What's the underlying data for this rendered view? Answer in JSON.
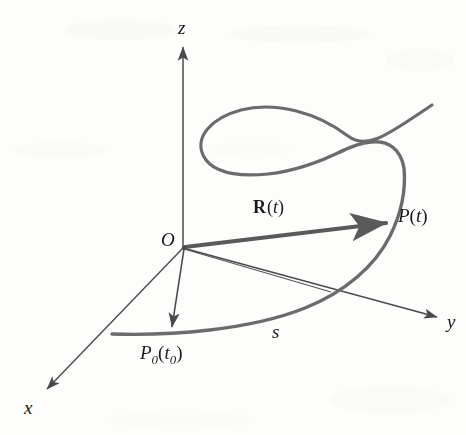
{
  "figure": {
    "background_color": "#fdfdfc",
    "curve_color": "#6b6b6b",
    "axis_color": "#4a4a4a",
    "vector_color": "#5a5a5a",
    "label_color": "#1a1a1a"
  },
  "axes": [
    {
      "name": "z-axis",
      "label": "z",
      "x": 178,
      "y": 18
    },
    {
      "name": "y-axis",
      "label": "y",
      "x": 447,
      "y": 312
    },
    {
      "name": "x-axis",
      "label": "x",
      "x": 24,
      "y": 398
    }
  ],
  "points": [
    {
      "name": "origin",
      "label": "O",
      "x": 161,
      "y": 230
    },
    {
      "name": "point-p-of-t",
      "label_main": "P",
      "label_paren_open": "(",
      "label_arg": "t",
      "label_paren_close": ")",
      "x": 398,
      "y": 206
    },
    {
      "name": "point-p-zero",
      "label_main": "P",
      "label_sub": "0",
      "label_paren_open": "(",
      "label_arg": "t",
      "label_arg_sub": "0",
      "label_paren_close": ")",
      "x": 140,
      "y": 343
    }
  ],
  "vector": {
    "name": "position-vector",
    "bold_symbol": "R",
    "paren_open": "(",
    "arg": "t",
    "paren_close": ")",
    "x": 253,
    "y": 198
  },
  "arc_length": {
    "name": "arc-length-parameter",
    "label": "s",
    "x": 272,
    "y": 322
  }
}
